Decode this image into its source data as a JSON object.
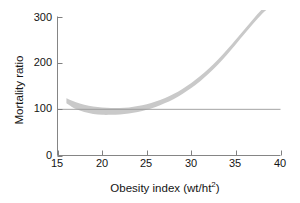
{
  "chart_data": {
    "type": "area",
    "title": "",
    "subtitle": "",
    "xlabel_text": "Obesity index (wt/ht",
    "xlabel_sup": "2",
    "xlabel_close": ")",
    "xlabel": "Obesity index (wt/ht2)",
    "ylabel": "Mortality ratio",
    "xlim": [
      15,
      40
    ],
    "ylim": [
      0,
      300
    ],
    "xticks": [
      15,
      20,
      25,
      30,
      35,
      40
    ],
    "xtick_labels": [
      "15",
      "20",
      "25",
      "30",
      "35",
      "40"
    ],
    "yticks": [
      0,
      100,
      200,
      300
    ],
    "ytick_labels": [
      "0",
      "100",
      "200",
      "300"
    ],
    "grid": false,
    "legend": null,
    "legend_position": "none",
    "band_color": "#c9c9c9",
    "axis_color": "#808080",
    "reference_line": {
      "orientation": "horizontal",
      "value": 100,
      "color": "#9a9a9a",
      "x_from": 15,
      "x_to": 40
    },
    "series": [
      {
        "name": "Mortality ratio confidence band (upper bound)",
        "x": [
          16,
          17,
          18,
          19,
          20,
          21,
          22,
          23,
          24,
          25,
          26,
          27,
          28,
          29,
          30,
          31,
          32,
          33,
          34,
          35,
          36,
          37,
          38,
          39,
          40
        ],
        "values": [
          124,
          116,
          110,
          106,
          104,
          103,
          103,
          104,
          107,
          111,
          117,
          124,
          133,
          144,
          157,
          172,
          189,
          208,
          229,
          251,
          274,
          297,
          318,
          334,
          345
        ]
      },
      {
        "name": "Mortality ratio confidence band (lower bound)",
        "x": [
          16,
          17,
          18,
          19,
          20,
          21,
          22,
          23,
          24,
          25,
          26,
          27,
          28,
          29,
          30,
          31,
          32,
          33,
          34,
          35,
          36,
          37,
          38,
          39,
          40
        ],
        "values": [
          113,
          101,
          94,
          90,
          88,
          88,
          89,
          91,
          94,
          99,
          105,
          113,
          122,
          133,
          146,
          161,
          178,
          197,
          218,
          241,
          264,
          287,
          308,
          324,
          335
        ]
      },
      {
        "name": "Mortality ratio (band midline)",
        "x": [
          16,
          17,
          18,
          19,
          20,
          21,
          22,
          23,
          24,
          25,
          26,
          27,
          28,
          29,
          30,
          31,
          32,
          33,
          34,
          35,
          36,
          37,
          38,
          39,
          40
        ],
        "values": [
          118,
          108,
          102,
          98,
          96,
          95,
          96,
          97,
          100,
          105,
          111,
          118,
          127,
          138,
          151,
          166,
          183,
          202,
          223,
          246,
          269,
          292,
          313,
          329,
          340
        ]
      }
    ]
  }
}
